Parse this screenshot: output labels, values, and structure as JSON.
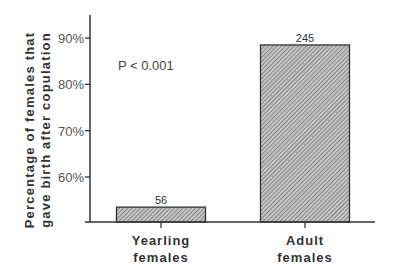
{
  "chart_data": {
    "type": "bar",
    "title": "",
    "xlabel": "",
    "ylabel_lines": [
      "Percentage of females that",
      "gave birth after copulation"
    ],
    "categories": [
      {
        "lines": [
          "Yearling",
          "females"
        ]
      },
      {
        "lines": [
          "Adult",
          "females"
        ]
      }
    ],
    "values": [
      53.5,
      88.5
    ],
    "data_labels": [
      "56",
      "245"
    ],
    "yticks": [
      60,
      70,
      80,
      90
    ],
    "ytick_labels": [
      "60%",
      "70%",
      "80%",
      "90%"
    ],
    "ylim": [
      50,
      97
    ],
    "grid": false,
    "annotation": "P < 0.001",
    "bar_fill": "hatched-gray",
    "colors": {
      "bar": "#9a9a9a",
      "axis": "#333333"
    }
  }
}
